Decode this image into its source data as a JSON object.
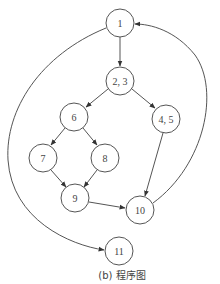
{
  "caption": "(b) 程序图",
  "nodes": [
    {
      "id": "1",
      "label": "1",
      "x": 120,
      "y": 23
    },
    {
      "id": "2,3",
      "label": "2, 3",
      "x": 120,
      "y": 81
    },
    {
      "id": "6",
      "label": "6",
      "x": 74,
      "y": 117
    },
    {
      "id": "4,5",
      "label": "4, 5",
      "x": 166,
      "y": 119
    },
    {
      "id": "7",
      "label": "7",
      "x": 43,
      "y": 158
    },
    {
      "id": "8",
      "label": "8",
      "x": 105,
      "y": 158
    },
    {
      "id": "9",
      "label": "9",
      "x": 75,
      "y": 198
    },
    {
      "id": "10",
      "label": "10",
      "x": 140,
      "y": 210
    },
    {
      "id": "11",
      "label": "11",
      "x": 119,
      "y": 251
    }
  ],
  "edges": [
    {
      "from": "1",
      "to": "2,3"
    },
    {
      "from": "2,3",
      "to": "6"
    },
    {
      "from": "2,3",
      "to": "4,5"
    },
    {
      "from": "6",
      "to": "7"
    },
    {
      "from": "6",
      "to": "8"
    },
    {
      "from": "7",
      "to": "9"
    },
    {
      "from": "8",
      "to": "9"
    },
    {
      "from": "9",
      "to": "10"
    },
    {
      "from": "4,5",
      "to": "10"
    },
    {
      "from": "10",
      "to": "1"
    },
    {
      "from": "1",
      "to": "11"
    }
  ]
}
